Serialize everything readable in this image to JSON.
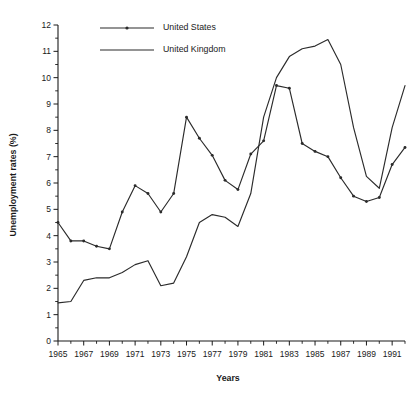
{
  "chart_data": {
    "type": "line",
    "title": "",
    "xlabel": "Years",
    "ylabel": "Unemployment rates (%)",
    "xlim": [
      1965,
      1992
    ],
    "ylim": [
      0,
      12
    ],
    "grid": false,
    "legend_position": "top-left",
    "x": [
      1965,
      1966,
      1967,
      1968,
      1969,
      1970,
      1971,
      1972,
      1973,
      1974,
      1975,
      1976,
      1977,
      1978,
      1979,
      1980,
      1981,
      1982,
      1983,
      1984,
      1985,
      1986,
      1987,
      1988,
      1989,
      1990,
      1991,
      1992
    ],
    "xtick_labels": [
      "1965",
      "1967",
      "1969",
      "1971",
      "1973",
      "1975",
      "1977",
      "1979",
      "1981",
      "1983",
      "1985",
      "1987",
      "1989",
      "1991"
    ],
    "xtick_values": [
      1965,
      1967,
      1969,
      1971,
      1973,
      1975,
      1977,
      1979,
      1981,
      1983,
      1985,
      1987,
      1989,
      1991
    ],
    "ytick_labels": [
      "0",
      "1",
      "2",
      "3",
      "4",
      "5",
      "6",
      "7",
      "8",
      "9",
      "10",
      "11",
      "12"
    ],
    "ytick_values": [
      0,
      1,
      2,
      3,
      4,
      5,
      6,
      7,
      8,
      9,
      10,
      11,
      12
    ],
    "series": [
      {
        "name": "United States",
        "marker": "dot",
        "color": "#2b2b2b",
        "values": [
          4.5,
          3.8,
          3.8,
          3.6,
          3.5,
          4.9,
          5.9,
          5.6,
          4.9,
          5.6,
          8.5,
          7.7,
          7.05,
          6.1,
          5.75,
          7.1,
          7.6,
          9.7,
          9.6,
          7.5,
          7.2,
          7.0,
          6.2,
          5.5,
          5.3,
          5.45,
          6.7,
          7.35
        ]
      },
      {
        "name": "United Kingdom",
        "marker": "none",
        "color": "#2b2b2b",
        "values": [
          1.45,
          1.5,
          2.3,
          2.4,
          2.4,
          2.6,
          2.9,
          3.05,
          2.1,
          2.2,
          3.2,
          4.5,
          4.8,
          4.7,
          4.35,
          5.6,
          8.5,
          10.0,
          10.8,
          11.1,
          11.2,
          11.45,
          10.5,
          8.1,
          6.25,
          5.8,
          8.1,
          9.7
        ]
      }
    ]
  },
  "legend": {
    "entries": [
      {
        "label": "United States"
      },
      {
        "label": "United Kingdom"
      }
    ]
  },
  "axes": {
    "x_title": "Years",
    "y_title": "Unemployment rates (%)"
  }
}
